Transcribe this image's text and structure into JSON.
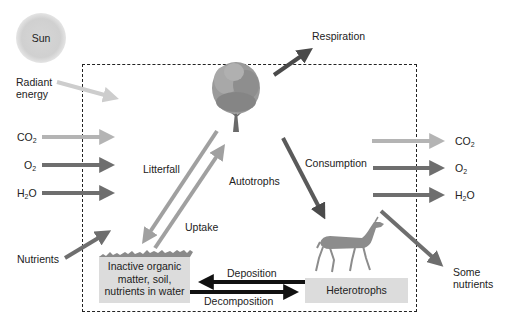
{
  "diagram": {
    "type": "ecosystem nutrient cycle",
    "boundary": "dashed ecosystem boundary",
    "sun": {
      "label": "Sun"
    },
    "inputs": [
      {
        "id": "radiant",
        "label": "Radiant energy",
        "label_line1": "Radiant",
        "label_line2": "energy",
        "color": "#c8c8c8"
      },
      {
        "id": "co2_in",
        "label": "CO2",
        "base": "CO",
        "sub": "2",
        "color": "#b0b0b0"
      },
      {
        "id": "o2_in",
        "label": "O2",
        "base": "O",
        "sub": "2",
        "color": "#707070"
      },
      {
        "id": "h2o_in",
        "label": "H2O",
        "base": "H",
        "sub": "2",
        "tail": "O",
        "color": "#707070"
      },
      {
        "id": "nutrients_in",
        "label": "Nutrients",
        "color": "#707070"
      }
    ],
    "outputs": [
      {
        "id": "respiration",
        "label": "Respiration",
        "color": "#555555"
      },
      {
        "id": "co2_out",
        "label": "CO2",
        "base": "CO",
        "sub": "2",
        "color": "#b0b0b0"
      },
      {
        "id": "o2_out",
        "label": "O2",
        "base": "O",
        "sub": "2",
        "color": "#707070"
      },
      {
        "id": "h2o_out",
        "label": "H2O",
        "base": "H",
        "sub": "2",
        "tail": "O",
        "color": "#707070"
      },
      {
        "id": "some_nutrients",
        "label": "Some nutrients",
        "label_line1": "Some",
        "label_line2": "nutrients",
        "color": "#707070"
      }
    ],
    "nodes": {
      "autotrophs": {
        "label": "Autotrophs"
      },
      "heterotrophs": {
        "label": "Heterotrophs"
      },
      "inactive": {
        "line1": "Inactive organic",
        "line2": "matter, soil,",
        "line3": "nutrients in water"
      }
    },
    "flows": {
      "litterfall": "Litterfall",
      "uptake": "Uptake",
      "consumption": "Consumption",
      "deposition": "Deposition",
      "decomposition": "Decomposition"
    }
  }
}
